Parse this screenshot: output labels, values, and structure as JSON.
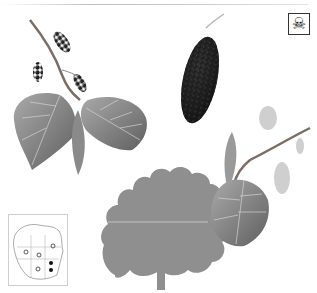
{
  "illustration": {
    "subject": "Mulberry tree botanical plate",
    "elements": {
      "fruiting_branch": "branch with heart-shaped serrated leaves and small dark mulberry fruits",
      "large_fruit": "enlarged dark mulberry fruit with stem",
      "tree_silhouette": "gray silhouette of mature broad-crowned tree",
      "flowering_branch": "twig with large leaf and pale catkin flowers",
      "range_map": "small map of North America with range markers"
    },
    "warning_icon": {
      "icon": "skull-crossbones-icon",
      "glyph": "☠"
    },
    "range_map": {
      "markers": [
        {
          "type": "open-circle",
          "x": 25,
          "y": 43
        },
        {
          "type": "open-circle",
          "x": 38,
          "y": 46
        },
        {
          "type": "open-circle",
          "x": 52,
          "y": 37
        },
        {
          "type": "open-circle",
          "x": 37,
          "y": 60
        },
        {
          "type": "filled-circle",
          "x": 50,
          "y": 54
        },
        {
          "type": "filled-circle",
          "x": 50,
          "y": 61
        }
      ]
    }
  },
  "colors": {
    "background": "#ffffff",
    "silhouette": "#8f8f8f",
    "leaf": "#8a8a8a",
    "leaf_dark": "#5e5e5e",
    "fruit": "#1c1c1c",
    "stem": "#7a6f66"
  }
}
